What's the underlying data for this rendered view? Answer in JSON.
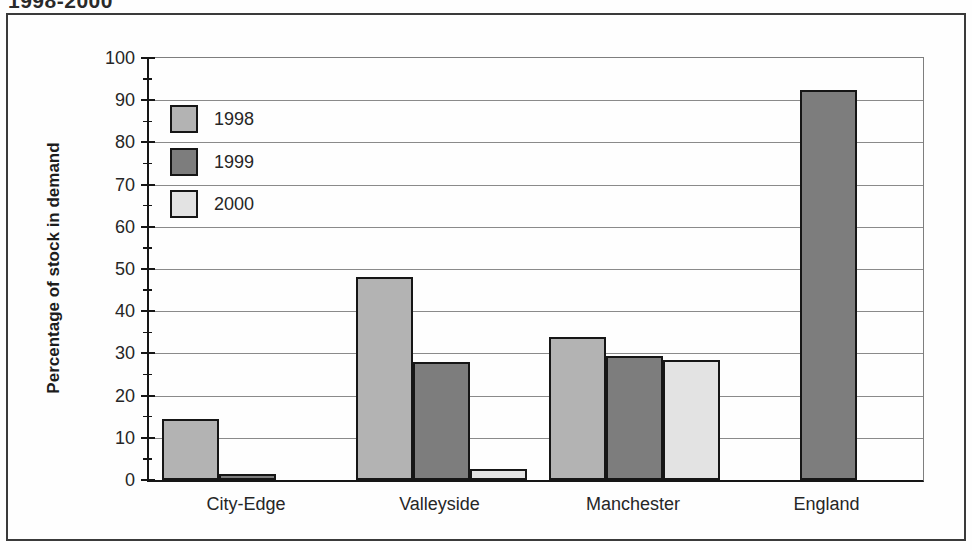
{
  "page": {
    "cropped_title": "1998-2000"
  },
  "chart_data": {
    "type": "bar",
    "title": "1998-2000",
    "title_note": "title partially cropped at top edge of scan",
    "ylabel": "Percentage of stock in demand",
    "xlabel": "",
    "categories": [
      "City-Edge",
      "Valleyside",
      "Manchester",
      "England"
    ],
    "series": [
      {
        "name": "1998",
        "color": "#b3b3b3",
        "values": [
          14.5,
          48,
          34,
          null
        ]
      },
      {
        "name": "1999",
        "color": "#7d7d7d",
        "values": [
          1.5,
          28,
          29.5,
          92.5
        ]
      },
      {
        "name": "2000",
        "color": "#e3e3e3",
        "values": [
          null,
          2.5,
          28.5,
          null
        ]
      }
    ],
    "ylim": [
      0,
      100
    ],
    "y_ticks": [
      0,
      10,
      20,
      30,
      40,
      50,
      60,
      70,
      80,
      90,
      100
    ],
    "y_minor_tick_step": 5,
    "grid": "horizontal-major",
    "legend_position": "inside-top-left",
    "legend_entries": [
      "1998",
      "1999",
      "2000"
    ]
  },
  "colors": {
    "bar_fill_1998": "#b3b3b3",
    "bar_fill_1999": "#7d7d7d",
    "bar_fill_2000": "#e3e3e3",
    "bar_border": "#161616",
    "gridline": "#8a8a8a",
    "axis": "#161616",
    "frame_border": "#3a3a3a",
    "text": "#1c1c1c",
    "background": "#fefefe"
  }
}
